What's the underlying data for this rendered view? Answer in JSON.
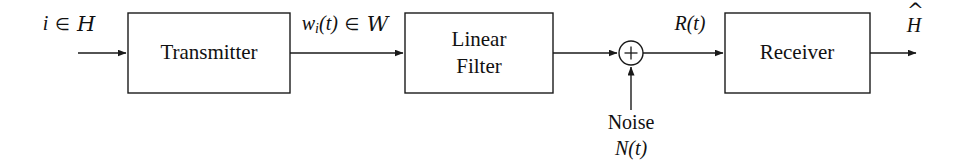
{
  "diagram": {
    "background_color": "#ffffff",
    "line_color": "#1a1a1a",
    "blocks": [
      {
        "id": "transmitter",
        "label": "Transmitter",
        "x": 128,
        "y": 13,
        "width": 162,
        "height": 80
      },
      {
        "id": "linear-filter",
        "label_line1": "Linear",
        "label_line2": "Filter",
        "x": 405,
        "y": 13,
        "width": 148,
        "height": 80
      },
      {
        "id": "receiver",
        "label": "Receiver",
        "x": 725,
        "y": 13,
        "width": 145,
        "height": 80
      }
    ],
    "summing_junction": {
      "id": "summing-node",
      "symbol": "+",
      "cx": 631,
      "cy": 53,
      "r": 12
    },
    "signals": {
      "input": {
        "text": "i ∈ H",
        "variable": "i",
        "operator": "∈",
        "set": "H",
        "x": 69,
        "y": 25
      },
      "transmitted": {
        "text": "w_i(t) ∈ W",
        "variable": "w",
        "subscript": "i",
        "argument": "(t)",
        "operator": "∈",
        "set": "W",
        "x": 345,
        "y": 25
      },
      "received": {
        "text": "R(t)",
        "variable": "R",
        "argument": "(t)",
        "x": 690,
        "y": 25
      },
      "noise_word": {
        "text": "Noise",
        "x": 631,
        "y": 124
      },
      "noise_signal": {
        "text": "N(t)",
        "variable": "N",
        "argument": "(t)",
        "x": 631,
        "y": 150
      },
      "output": {
        "text": "Ĥ",
        "variable": "H",
        "accent": "hat",
        "x": 914,
        "y": 25
      }
    },
    "arrows": [
      {
        "id": "arrow-input-to-transmitter",
        "from_x": 78,
        "from_y": 53,
        "to_x": 128,
        "to_y": 53
      },
      {
        "id": "arrow-transmitter-to-filter",
        "from_x": 290,
        "from_y": 53,
        "to_x": 405,
        "to_y": 53
      },
      {
        "id": "arrow-filter-to-sum",
        "from_x": 553,
        "from_y": 53,
        "to_x": 619,
        "to_y": 53
      },
      {
        "id": "arrow-noise-to-sum",
        "from_x": 631,
        "from_y": 110,
        "to_x": 631,
        "to_y": 65
      },
      {
        "id": "arrow-sum-to-receiver",
        "from_x": 643,
        "from_y": 53,
        "to_x": 725,
        "to_y": 53
      },
      {
        "id": "arrow-receiver-to-output",
        "from_x": 870,
        "from_y": 53,
        "to_x": 918,
        "to_y": 53
      }
    ]
  }
}
